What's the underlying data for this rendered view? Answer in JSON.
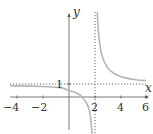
{
  "title": "",
  "function": "y = 1 + 1/(x - 2)",
  "axes": {
    "x_label": "x",
    "y_label": "y",
    "x_ticks": [
      "−4",
      "−2",
      "2",
      "4",
      "6"
    ],
    "y_ticks": [
      "1"
    ]
  },
  "asymptotes": {
    "vertical": "x = 2",
    "horizontal": "y = 1"
  },
  "colors": {
    "axis": "#555555",
    "curve": "#b5b5b5",
    "asymptote": "#666666",
    "text": "#333333"
  }
}
